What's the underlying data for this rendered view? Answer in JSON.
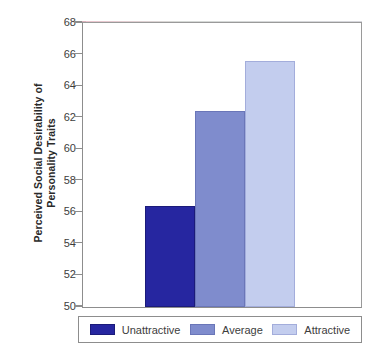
{
  "chart_data": {
    "type": "bar",
    "title": "",
    "xlabel": "",
    "ylabel_line1": "Perceived Social Desirability of",
    "ylabel_line2": "Personality Traits",
    "categories": [
      "Unattractive",
      "Average",
      "Attractive"
    ],
    "values": [
      56.4,
      62.4,
      65.6
    ],
    "ylim": [
      50,
      68
    ],
    "ytick_step": 2,
    "yticks": [
      50,
      52,
      54,
      56,
      58,
      60,
      62,
      64,
      66,
      68
    ],
    "ytick_labels": [
      "50",
      "52",
      "54",
      "56",
      "58",
      "60",
      "62",
      "64",
      "66",
      "68"
    ],
    "grid": false,
    "legend_position": "bottom",
    "series": [
      {
        "name": "Unattractive",
        "value": 56.4,
        "color": "#2626a0"
      },
      {
        "name": "Average",
        "value": 62.4,
        "color": "#7f8ccd"
      },
      {
        "name": "Attractive",
        "value": 65.6,
        "color": "#c3cdee"
      }
    ],
    "colors": {
      "unattractive": "#2626a0",
      "average": "#7f8ccd",
      "attractive": "#c3cdee",
      "axis": "#8d8d8d",
      "text": "#3d3d3d",
      "background": "#ffffff"
    }
  },
  "legend": {
    "items": [
      {
        "label": "Unattractive"
      },
      {
        "label": "Average"
      },
      {
        "label": "Attractive"
      }
    ]
  }
}
